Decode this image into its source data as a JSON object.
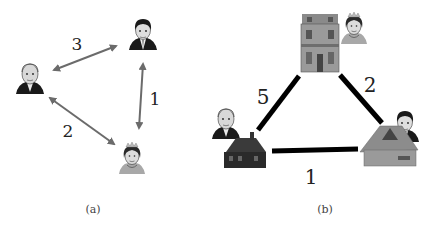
{
  "panels": [
    {
      "id": "a",
      "caption": "(a)",
      "nodes": [
        {
          "id": "man-left",
          "kind": "portrait-older-man"
        },
        {
          "id": "man-right",
          "kind": "portrait-younger-man"
        },
        {
          "id": "queen",
          "kind": "portrait-woman-tiara"
        }
      ],
      "edges": [
        {
          "from": "man-left",
          "to": "man-right",
          "weight": "3",
          "style": "double-arrow"
        },
        {
          "from": "man-right",
          "to": "queen",
          "weight": "1",
          "style": "double-arrow"
        },
        {
          "from": "man-left",
          "to": "queen",
          "weight": "2",
          "style": "double-arrow"
        }
      ]
    },
    {
      "id": "b",
      "caption": "(b)",
      "nodes": [
        {
          "id": "mansion",
          "kind": "townhouse",
          "owner": "queen"
        },
        {
          "id": "cottage-left",
          "kind": "dark-house",
          "owner": "man-left"
        },
        {
          "id": "hut-right",
          "kind": "thatched-hut",
          "owner": "man-right"
        }
      ],
      "edges": [
        {
          "from": "mansion",
          "to": "cottage-left",
          "weight": "5",
          "style": "thick-line"
        },
        {
          "from": "mansion",
          "to": "hut-right",
          "weight": "2",
          "style": "thick-line"
        },
        {
          "from": "cottage-left",
          "to": "hut-right",
          "weight": "1",
          "style": "thick-line"
        }
      ]
    }
  ],
  "colors": {
    "arrow": "#6b6b6b",
    "line": "#000000",
    "caption": "#444444"
  }
}
